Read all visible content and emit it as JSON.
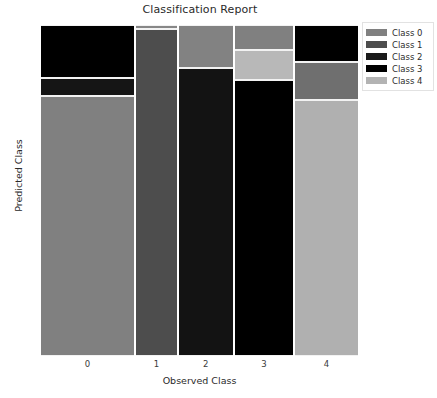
{
  "chart_data": {
    "type": "mosaic",
    "title": "Classification Report",
    "xlabel": "Observed Class",
    "ylabel": "Predicted Class",
    "categories": [
      "0",
      "1",
      "2",
      "3",
      "4"
    ],
    "xtick_labels": [
      "0",
      "1",
      "2",
      "3",
      "4"
    ],
    "legend": {
      "position": "upper right",
      "entries": [
        {
          "label": "Class 0",
          "color": "#808080"
        },
        {
          "label": "Class 1",
          "color": "#4d4d4d"
        },
        {
          "label": "Class 2",
          "color": "#1a1a1a"
        },
        {
          "label": "Class 3",
          "color": "#000000"
        },
        {
          "label": "Class 4",
          "color": "#b3b3b3"
        }
      ]
    },
    "grid": false,
    "columns": [
      {
        "observed": "0",
        "width_frac": 0.294,
        "tiles": [
          {
            "predicted": "Class 3",
            "color": "#000000",
            "height_frac": 0.16
          },
          {
            "predicted": "Class 2",
            "color": "#151515",
            "height_frac": 0.055
          },
          {
            "predicted": "Class 0",
            "color": "#808080",
            "height_frac": 0.785
          }
        ]
      },
      {
        "observed": "1",
        "width_frac": 0.13,
        "tiles": [
          {
            "predicted": "Class 0",
            "color": "#878787",
            "height_frac": 0.012
          },
          {
            "predicted": "Class 1",
            "color": "#4d4d4d",
            "height_frac": 0.988
          }
        ]
      },
      {
        "observed": "2",
        "width_frac": 0.172,
        "tiles": [
          {
            "predicted": "Class 0",
            "color": "#828282",
            "height_frac": 0.13
          },
          {
            "predicted": "Class 2",
            "color": "#131313",
            "height_frac": 0.87
          }
        ]
      },
      {
        "observed": "3",
        "width_frac": 0.185,
        "tiles": [
          {
            "predicted": "Class 0",
            "color": "#808080",
            "height_frac": 0.076
          },
          {
            "predicted": "Class 4",
            "color": "#b8b8b8",
            "height_frac": 0.091
          },
          {
            "predicted": "Class 3",
            "color": "#000000",
            "height_frac": 0.833
          }
        ]
      },
      {
        "observed": "4",
        "width_frac": 0.199,
        "tiles": [
          {
            "predicted": "Class 3",
            "color": "#000000",
            "height_frac": 0.112
          },
          {
            "predicted": "Class 1",
            "color": "#6f6f6f",
            "height_frac": 0.115
          },
          {
            "predicted": "Class 4",
            "color": "#b0b0b0",
            "height_frac": 0.773
          }
        ]
      }
    ]
  }
}
